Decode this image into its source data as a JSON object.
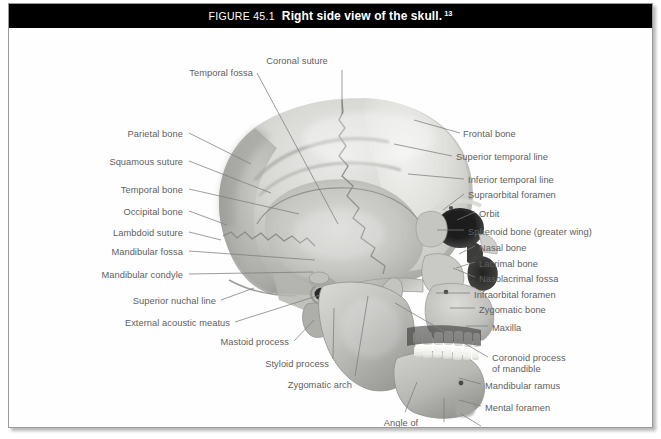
{
  "figure": {
    "label": "FIGURE 45.1",
    "title": "Right side view of the skull.",
    "superscript": "13",
    "caption_bar_color": "#000000",
    "caption_text_color": "#ffffff",
    "label_text_color": "#5f5f5f",
    "leader_line_color": "#7c7c7c",
    "frame_border_color": "#9a9a9a",
    "background_color": "#ffffff"
  },
  "labels": [
    {
      "id": "coronal-suture",
      "text": "Coronal suture",
      "side": "center",
      "x": 288,
      "y": 28,
      "lx": 333,
      "ly": 42,
      "tx": 333,
      "ty": 86
    },
    {
      "id": "temporal-fossa",
      "text": "Temporal fossa",
      "side": "left",
      "x": 244,
      "y": 40,
      "lx": 248,
      "ly": 45,
      "tx": 329,
      "ty": 196
    },
    {
      "id": "parietal-bone",
      "text": "Parietal bone",
      "side": "left",
      "x": 174,
      "y": 101,
      "lx": 180,
      "ly": 105,
      "tx": 242,
      "ty": 136
    },
    {
      "id": "squamous-suture",
      "text": "Squamous suture",
      "side": "left",
      "x": 174,
      "y": 129,
      "lx": 180,
      "ly": 133,
      "tx": 262,
      "ty": 165
    },
    {
      "id": "temporal-bone",
      "text": "Temporal bone",
      "side": "left",
      "x": 174,
      "y": 157,
      "lx": 180,
      "ly": 161,
      "tx": 290,
      "ty": 186
    },
    {
      "id": "occipital-bone",
      "text": "Occipital bone",
      "side": "left",
      "x": 174,
      "y": 179,
      "lx": 180,
      "ly": 183,
      "tx": 218,
      "ty": 197
    },
    {
      "id": "lambdoid-suture",
      "text": "Lambdoid suture",
      "side": "left",
      "x": 174,
      "y": 200,
      "lx": 180,
      "ly": 204,
      "tx": 212,
      "ty": 212
    },
    {
      "id": "mandibular-fossa",
      "text": "Mandibular fossa",
      "side": "left",
      "x": 174,
      "y": 219,
      "lx": 180,
      "ly": 223,
      "tx": 306,
      "ty": 232
    },
    {
      "id": "mandibular-condyle",
      "text": "Mandibular condyle",
      "side": "left",
      "x": 174,
      "y": 242,
      "lx": 180,
      "ly": 246,
      "tx": 304,
      "ty": 244
    },
    {
      "id": "superior-nuchal-line",
      "text": "Superior nuchal line",
      "side": "left",
      "x": 207,
      "y": 268,
      "lx": 212,
      "ly": 272,
      "tx": 245,
      "ty": 260
    },
    {
      "id": "external-acoustic-meatus",
      "text": "External acoustic meatus",
      "side": "left",
      "x": 221,
      "y": 290,
      "lx": 226,
      "ly": 294,
      "tx": 311,
      "ty": 267
    },
    {
      "id": "mastoid-process",
      "text": "Mastoid process",
      "side": "left",
      "x": 280,
      "y": 309,
      "lx": 285,
      "ly": 313,
      "tx": 305,
      "ty": 292
    },
    {
      "id": "styloid-process",
      "text": "Styloid process",
      "side": "left",
      "x": 320,
      "y": 331,
      "lx": 324,
      "ly": 331,
      "tx": 325,
      "ty": 280
    },
    {
      "id": "zygomatic-arch",
      "text": "Zygomatic arch",
      "side": "left",
      "x": 343,
      "y": 352,
      "lx": 346,
      "ly": 348,
      "tx": 359,
      "ty": 268
    },
    {
      "id": "angle-of-mandible",
      "text": "Angle of\nmandible",
      "side": "center",
      "x": 392,
      "y": 390,
      "lx": 396,
      "ly": 384,
      "tx": 408,
      "ty": 354
    },
    {
      "id": "mandible",
      "text": "Mandible",
      "side": "center",
      "x": 432,
      "y": 398,
      "lx": 435,
      "ly": 394,
      "tx": 435,
      "ty": 370
    },
    {
      "id": "frontal-bone",
      "text": "Frontal bone",
      "side": "right",
      "x": 454,
      "y": 101,
      "lx": 451,
      "ly": 105,
      "tx": 405,
      "ty": 92
    },
    {
      "id": "superior-temporal-line",
      "text": "Superior temporal line",
      "side": "right",
      "x": 447,
      "y": 124,
      "lx": 443,
      "ly": 128,
      "tx": 385,
      "ty": 116
    },
    {
      "id": "inferior-temporal-line",
      "text": "Inferior temporal line",
      "side": "right",
      "x": 459,
      "y": 147,
      "lx": 455,
      "ly": 151,
      "tx": 399,
      "ty": 146
    },
    {
      "id": "supraorbital-foramen",
      "text": "Supraorbital foramen",
      "side": "right",
      "x": 459,
      "y": 162,
      "lx": 455,
      "ly": 166,
      "tx": 434,
      "ty": 182
    },
    {
      "id": "orbit",
      "text": "Orbit",
      "side": "right",
      "x": 470,
      "y": 181,
      "lx": 466,
      "ly": 184,
      "tx": 448,
      "ty": 192
    },
    {
      "id": "sphenoid-bone",
      "text": "Sphenoid bone (greater wing)",
      "side": "right",
      "x": 459,
      "y": 199,
      "lx": 455,
      "ly": 202,
      "tx": 428,
      "ty": 202
    },
    {
      "id": "nasal-bone",
      "text": "Nasal bone",
      "side": "right",
      "x": 470,
      "y": 215,
      "lx": 466,
      "ly": 218,
      "tx": 450,
      "ty": 226
    },
    {
      "id": "lacrimal-bone",
      "text": "Lacrimal bone",
      "side": "right",
      "x": 470,
      "y": 231,
      "lx": 466,
      "ly": 234,
      "tx": 447,
      "ty": 240
    },
    {
      "id": "nasolacrimal-fossa",
      "text": "Nasolacrimal fossa",
      "side": "right",
      "x": 470,
      "y": 246,
      "lx": 466,
      "ly": 249,
      "tx": 444,
      "ty": 240
    },
    {
      "id": "infraorbital-foramen",
      "text": "Infraorbital foramen",
      "side": "right",
      "x": 465,
      "y": 262,
      "lx": 461,
      "ly": 265,
      "tx": 427,
      "ty": 265
    },
    {
      "id": "zygomatic-bone",
      "text": "Zygomatic bone",
      "side": "right",
      "x": 470,
      "y": 277,
      "lx": 466,
      "ly": 280,
      "tx": 441,
      "ty": 280
    },
    {
      "id": "maxilla",
      "text": "Maxilla",
      "side": "right",
      "x": 483,
      "y": 295,
      "lx": 479,
      "ly": 298,
      "tx": 457,
      "ty": 298
    },
    {
      "id": "coronoid-process",
      "text": "Coronoid process\nof mandible",
      "side": "right",
      "x": 483,
      "y": 325,
      "lx": 479,
      "ly": 329,
      "tx": 386,
      "ty": 275
    },
    {
      "id": "mandibular-ramus",
      "text": "Mandibular ramus",
      "side": "right",
      "x": 476,
      "y": 353,
      "lx": 472,
      "ly": 356,
      "tx": 450,
      "ty": 350
    },
    {
      "id": "mental-foramen",
      "text": "Mental foramen",
      "side": "right",
      "x": 476,
      "y": 375,
      "lx": 472,
      "ly": 378,
      "tx": 450,
      "ty": 372
    },
    {
      "id": "mental-tubercle",
      "text": "Mental tubercle",
      "side": "right",
      "x": 476,
      "y": 399,
      "lx": 472,
      "ly": 398,
      "tx": 452,
      "ty": 386
    }
  ]
}
